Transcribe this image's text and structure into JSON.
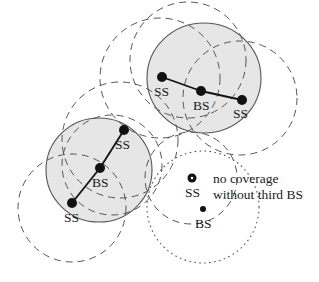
{
  "diagram": {
    "colors": {
      "cell_fill": "#e6e6e6",
      "cell_stroke": "#555555",
      "dash_stroke": "#555555",
      "node": "#111111",
      "link": "#111111"
    },
    "cells": [
      {
        "id": "top-cell",
        "cx": 204,
        "cy": 78,
        "rx": 57,
        "ry": 55
      },
      {
        "id": "left-cell",
        "cx": 99,
        "cy": 170,
        "rx": 53,
        "ry": 52
      }
    ],
    "dashed_circles": [
      {
        "id": "cov-top-ss-left",
        "cx": 160,
        "cy": 78,
        "r": 60
      },
      {
        "id": "cov-top-bs",
        "cx": 188,
        "cy": 60,
        "r": 58
      },
      {
        "id": "cov-top-ss-right",
        "cx": 240,
        "cy": 98,
        "r": 57
      },
      {
        "id": "cov-mid-ss",
        "cx": 120,
        "cy": 140,
        "r": 58
      },
      {
        "id": "cov-left-bs",
        "cx": 112,
        "cy": 165,
        "r": 50
      },
      {
        "id": "cov-left-ss-bottom",
        "cx": 72,
        "cy": 208,
        "r": 54
      },
      {
        "id": "cov-isolated-ss",
        "cx": 191,
        "cy": 178,
        "r": 46
      }
    ],
    "dotted_circles": [
      {
        "id": "cov-isolated-bs",
        "cx": 203,
        "cy": 207,
        "r": 56
      }
    ],
    "links": [
      {
        "x1": 162,
        "y1": 77,
        "x2": 201,
        "y2": 91
      },
      {
        "x1": 201,
        "y1": 91,
        "x2": 242,
        "y2": 100
      },
      {
        "x1": 124,
        "y1": 130,
        "x2": 100,
        "y2": 168
      },
      {
        "x1": 100,
        "y1": 168,
        "x2": 72,
        "y2": 203
      }
    ],
    "nodes": [
      {
        "id": "top-ss-left",
        "type": "SS",
        "x": 162,
        "y": 77,
        "r": 5,
        "label": "SS",
        "lx": 154,
        "ly": 96
      },
      {
        "id": "top-bs",
        "type": "BS",
        "x": 201,
        "y": 91,
        "r": 5,
        "label": "BS",
        "lx": 193,
        "ly": 110
      },
      {
        "id": "top-ss-right",
        "type": "SS",
        "x": 242,
        "y": 100,
        "r": 5,
        "label": "SS",
        "lx": 233,
        "ly": 118
      },
      {
        "id": "left-ss-top",
        "type": "SS",
        "x": 124,
        "y": 130,
        "r": 5,
        "label": "SS",
        "lx": 115,
        "ly": 149
      },
      {
        "id": "left-bs",
        "type": "BS",
        "x": 100,
        "y": 168,
        "r": 5,
        "label": "BS",
        "lx": 92,
        "ly": 187
      },
      {
        "id": "left-ss-bottom",
        "type": "SS",
        "x": 72,
        "y": 203,
        "r": 5,
        "label": "SS",
        "lx": 64,
        "ly": 222
      }
    ],
    "isolated": {
      "ss": {
        "x": 192,
        "y": 178,
        "label": "SS",
        "lx": 185,
        "ly": 197
      },
      "bs": {
        "x": 203,
        "y": 209,
        "label": "BS",
        "lx": 195,
        "ly": 228
      }
    },
    "annotation": {
      "line1": "no coverage",
      "line2": "without third BS",
      "x1": 213,
      "y1": 186,
      "x2": 213,
      "y2": 198
    }
  }
}
